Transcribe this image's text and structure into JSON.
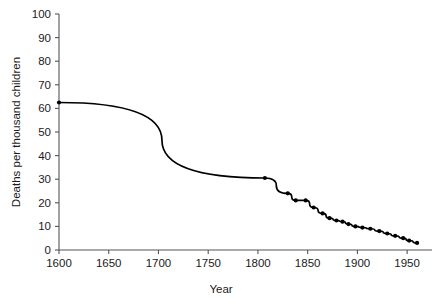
{
  "chart_data": {
    "type": "line",
    "title": "",
    "subtitle": "",
    "xlabel": "Year",
    "ylabel": "Deaths per thousand children",
    "xlim": [
      1600,
      1975
    ],
    "ylim": [
      0,
      100
    ],
    "xticks": [
      1600,
      1650,
      1700,
      1750,
      1800,
      1850,
      1900,
      1950
    ],
    "xtick_labels": [
      "1600",
      "1650",
      "1700",
      "1750",
      "1800",
      "1850",
      "1900",
      "1950"
    ],
    "yticks": [
      0,
      10,
      20,
      30,
      40,
      50,
      60,
      70,
      80,
      90,
      100
    ],
    "ytick_labels": [
      "0",
      "10",
      "20",
      "30",
      "40",
      "50",
      "60",
      "70",
      "80",
      "90",
      "100"
    ],
    "grid": false,
    "legend": false,
    "legend_position": "none",
    "marker": "filled-circle",
    "line_color": "#000000",
    "marker_color": "#000000",
    "axis_color": "#555555",
    "background_color": "#ffffff",
    "series": [
      {
        "name": "Deaths per thousand children",
        "x": [
          1600,
          1807,
          1830,
          1838,
          1848,
          1856,
          1865,
          1872,
          1879,
          1885,
          1891,
          1898,
          1905,
          1913,
          1922,
          1930,
          1938,
          1946,
          1952,
          1960
        ],
        "y": [
          62.5,
          30.5,
          24.0,
          21.0,
          21.0,
          18.0,
          15.5,
          13.5,
          12.5,
          12.0,
          11.0,
          10.0,
          9.5,
          9.0,
          8.0,
          7.0,
          6.0,
          5.0,
          4.0,
          3.0
        ]
      }
    ]
  },
  "axes": {
    "x_axis_title": "Year",
    "y_axis_title": "Deaths per thousand children"
  }
}
